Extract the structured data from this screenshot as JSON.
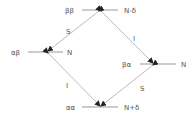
{
  "diagram": {
    "type": "energy-level-diagram",
    "colors": {
      "line": "#999999",
      "arrow": "#222222",
      "text": "#555555"
    },
    "levels": [
      {
        "id": "bb",
        "state": "ββ",
        "energy": "N-δ",
        "x1": 82,
        "x2": 118,
        "y": 10,
        "state_x": 65,
        "energy_x": 124
      },
      {
        "id": "ab",
        "state": "αβ",
        "energy": "N",
        "x1": 28,
        "x2": 63,
        "y": 52,
        "state_x": 11,
        "energy_x": 67
      },
      {
        "id": "ba",
        "state": "βα",
        "energy": "N",
        "x1": 140,
        "x2": 176,
        "y": 64,
        "state_x": 122,
        "energy_x": 181
      },
      {
        "id": "aa",
        "state": "αα",
        "energy": "N+δ",
        "x1": 82,
        "x2": 118,
        "y": 107,
        "state_x": 66,
        "energy_x": 124
      }
    ],
    "transitions": [
      {
        "from": "bb",
        "to": "ab",
        "label": "S",
        "label_x": 66,
        "label_y": 33
      },
      {
        "from": "bb",
        "to": "ba",
        "label": "I",
        "label_x": 133,
        "label_y": 39
      },
      {
        "from": "ab",
        "to": "aa",
        "label": "I",
        "label_x": 66,
        "label_y": 86
      },
      {
        "from": "ba",
        "to": "aa",
        "label": "S",
        "label_x": 140,
        "label_y": 89
      }
    ]
  }
}
